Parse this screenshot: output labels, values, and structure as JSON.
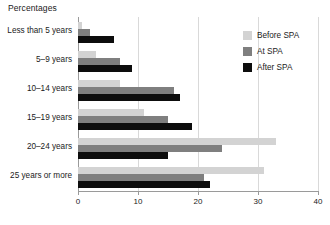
{
  "chart_data": {
    "type": "bar",
    "orientation": "horizontal",
    "title": "Percentages",
    "xlabel": "",
    "ylabel": "",
    "xlim": [
      0,
      40
    ],
    "xticks": [
      0,
      10,
      20,
      30,
      40
    ],
    "xtick_labels": [
      "0",
      "10",
      "20",
      "30",
      "40"
    ],
    "grid": true,
    "grid_axis": "x",
    "legend_position": "top-right",
    "categories": [
      "Less than 5 years",
      "5–9 years",
      "10–14 years",
      "15–19 years",
      "20–24 years",
      "25 years or more"
    ],
    "series": [
      {
        "name": "Before SPA",
        "color": "#d3d3d3",
        "values": [
          0.7,
          3,
          7,
          11,
          33,
          31
        ]
      },
      {
        "name": "At SPA",
        "color": "#7f7f7f",
        "values": [
          2,
          7,
          16,
          15,
          24,
          21
        ]
      },
      {
        "name": "After SPA",
        "color": "#0d0d0d",
        "values": [
          6,
          9,
          17,
          19,
          15,
          22
        ]
      }
    ]
  },
  "axis": {
    "tick_0": "0",
    "tick_1": "10",
    "tick_2": "20",
    "tick_3": "30",
    "tick_4": "40"
  }
}
